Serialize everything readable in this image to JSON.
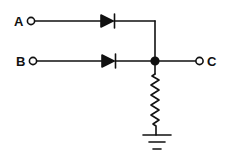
{
  "diagram": {
    "type": "diode-or-gate",
    "colors": {
      "stroke": "#111111",
      "background": "#ffffff"
    },
    "inputs": [
      {
        "label": "A"
      },
      {
        "label": "B"
      }
    ],
    "output": {
      "label": "C"
    },
    "components": [
      {
        "name": "diode-a",
        "kind": "diode",
        "from": "A",
        "to": "junction"
      },
      {
        "name": "diode-b",
        "kind": "diode",
        "from": "B",
        "to": "junction"
      },
      {
        "name": "resistor",
        "kind": "resistor",
        "from": "junction",
        "to": "ground"
      },
      {
        "name": "ground",
        "kind": "ground"
      }
    ]
  }
}
